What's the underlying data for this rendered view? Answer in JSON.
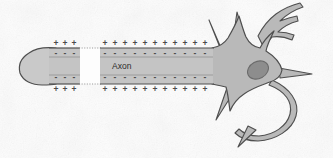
{
  "figure": {
    "width": 333,
    "height": 158
  },
  "colors": {
    "background": "#fdfdfd",
    "cell_fill": "#b9b9b9",
    "axon_fill": "#c2c2c2",
    "terminal_fill": "#c9c9c9",
    "nucleus_fill": "#8d8d8d",
    "outline": "#4f4f4f",
    "nucleus_outline": "#6a6a6a",
    "charge_color": "#4a4a4a",
    "membrane_line": "#7a7a7a",
    "dotted_line": "#9a9a9a",
    "label_color": "#2b2b2b"
  },
  "labels": {
    "axon": "Axon"
  },
  "charges": {
    "positive_symbol": "+",
    "negative_symbol": "-",
    "outer_top": {
      "symbol": "+",
      "segment_left_count": 3,
      "segment_right_count": 11,
      "description": "Positive charges outside membrane, top"
    },
    "inner_top": {
      "symbol": "-",
      "segment_left_count": 3,
      "segment_right_count": 11,
      "description": "Negative charges inside membrane, top"
    },
    "inner_bottom": {
      "symbol": "-",
      "segment_left_count": 3,
      "segment_right_count": 11,
      "description": "Negative charges inside membrane, bottom"
    },
    "outer_bottom": {
      "symbol": "+",
      "segment_left_count": 3,
      "segment_right_count": 11,
      "description": "Positive charges outside membrane, bottom"
    }
  },
  "parts": {
    "terminal_bulb": "axon-terminal-bulb",
    "axon_segment_left": "axon-segment-left",
    "axon_gap": "axon-gap-node",
    "axon_segment_right": "axon-segment-right",
    "soma": "cell-body-soma",
    "nucleus": "cell-nucleus",
    "dendrites": [
      "dendrite-upper-left",
      "dendrite-upper-mid",
      "dendrite-branched-upper-right",
      "dendrite-right",
      "dendrite-lower-loop",
      "dendrite-lower-left",
      "dendrite-lower-spike"
    ]
  },
  "geometry": {
    "terminal_center": {
      "cx": 37,
      "cy": 66,
      "rx": 18,
      "ry": 19
    },
    "axon_left": {
      "x": 48,
      "y": 48,
      "w": 32,
      "h": 36
    },
    "axon_right": {
      "x": 100,
      "y": 48,
      "w": 112,
      "h": 36
    },
    "gap": {
      "x": 80,
      "y": 48,
      "w": 20,
      "h": 36
    },
    "nucleus": {
      "cx": 258,
      "cy": 70,
      "rx": 11,
      "ry": 8.5,
      "rotation": -28
    },
    "axon_label_pos": {
      "x": 112,
      "y": 69
    }
  }
}
